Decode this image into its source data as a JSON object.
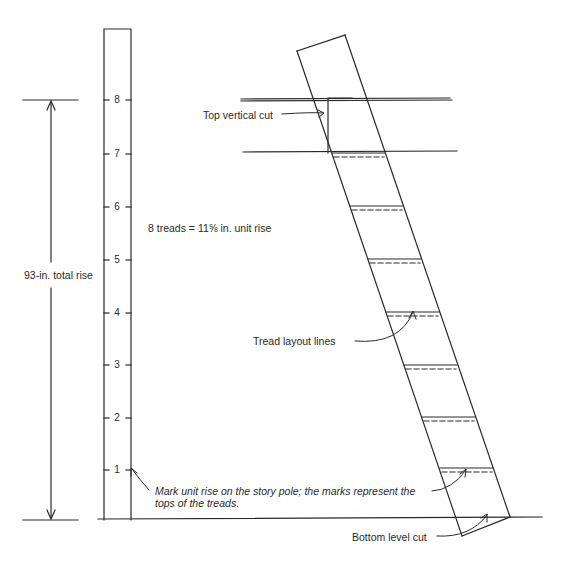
{
  "figure": {
    "colors": {
      "ink": "#2a2a2a",
      "background": "#ffffff"
    }
  },
  "story_pole": {
    "marks": [
      "1",
      "2",
      "3",
      "4",
      "5",
      "6",
      "7",
      "8"
    ],
    "mark_y": [
      470,
      418,
      365,
      313,
      260,
      207,
      154,
      100
    ]
  },
  "labels": {
    "total_rise": "93-in. total rise",
    "unit_rise": "8 treads  =  11⅝ in. unit rise",
    "top_cut": "Top vertical cut",
    "tread_lines": "Tread layout lines",
    "mark_note_line1": "Mark unit rise on the story pole; the marks represent the",
    "mark_note_line2": "tops of the treads.",
    "bottom_cut": "Bottom level cut"
  },
  "stringer": {
    "tread_count": 8,
    "tread_y": [
      153,
      206,
      259,
      312,
      365,
      417,
      470
    ]
  }
}
